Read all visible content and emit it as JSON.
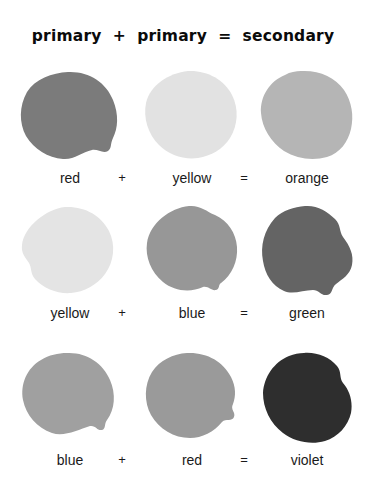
{
  "page": {
    "title": "primary  +  primary  =  secondary",
    "background_color": "#ffffff",
    "text_color": "#1a1a1a",
    "title_color": "#0b0b0b"
  },
  "operators": {
    "plus": "+",
    "equals": "="
  },
  "rows": [
    {
      "id": "row-red-yellow-orange",
      "a": {
        "label": "red",
        "color": "#7b7b7b"
      },
      "op1": "+",
      "b": {
        "label": "yellow",
        "color": "#e2e2e2"
      },
      "op2": "=",
      "c": {
        "label": "orange",
        "color": "#b5b5b5"
      }
    },
    {
      "id": "row-yellow-blue-green",
      "a": {
        "label": "yellow",
        "color": "#e4e4e4"
      },
      "op1": "+",
      "b": {
        "label": "blue",
        "color": "#979797"
      },
      "op2": "=",
      "c": {
        "label": "green",
        "color": "#646464"
      }
    },
    {
      "id": "row-blue-red-violet",
      "a": {
        "label": "blue",
        "color": "#a0a0a0"
      },
      "op1": "+",
      "b": {
        "label": "red",
        "color": "#9a9a9a"
      },
      "op2": "=",
      "c": {
        "label": "violet",
        "color": "#2e2e2e"
      }
    }
  ]
}
